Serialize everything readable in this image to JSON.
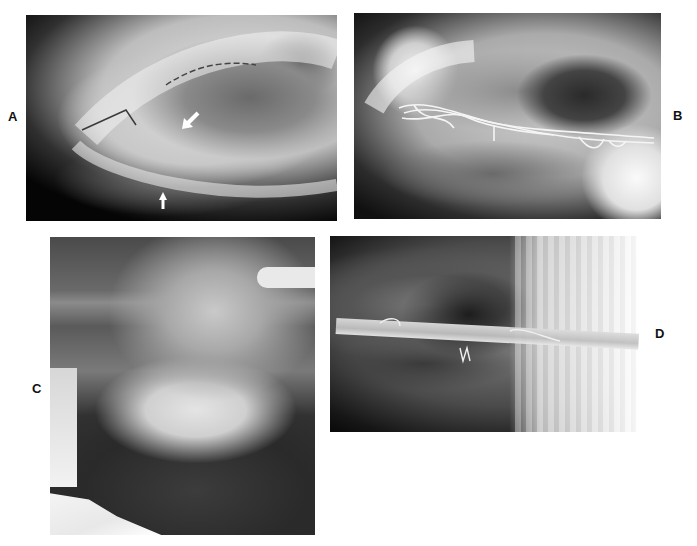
{
  "figure": {
    "panels": [
      {
        "id": "A",
        "label": "A",
        "type": "radiograph",
        "annotations": [
          "arrow-down-left",
          "arrow-up"
        ]
      },
      {
        "id": "B",
        "label": "B",
        "type": "radiograph",
        "annotations": [
          "wire-fixation"
        ]
      },
      {
        "id": "C",
        "label": "C",
        "type": "photograph",
        "annotations": []
      },
      {
        "id": "D",
        "label": "D",
        "type": "radiograph",
        "annotations": [
          "rod-fixation"
        ]
      }
    ],
    "caption": "",
    "colors": {
      "background": "#ffffff",
      "label": "#111111",
      "arrow": "#ffffff"
    }
  }
}
